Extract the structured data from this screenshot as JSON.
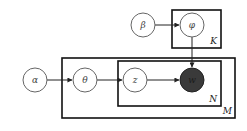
{
  "diagram": {
    "type": "plate-notation",
    "nodes": [
      {
        "id": "alpha",
        "label": "α",
        "observed": false
      },
      {
        "id": "theta",
        "label": "θ",
        "observed": false
      },
      {
        "id": "z",
        "label": "z",
        "observed": false
      },
      {
        "id": "w",
        "label": "w",
        "observed": true
      },
      {
        "id": "beta",
        "label": "β",
        "observed": false
      },
      {
        "id": "phi",
        "label": "φ",
        "observed": false
      }
    ],
    "edges": [
      {
        "from": "alpha",
        "to": "theta"
      },
      {
        "from": "theta",
        "to": "z"
      },
      {
        "from": "z",
        "to": "w"
      },
      {
        "from": "beta",
        "to": "phi"
      },
      {
        "from": "phi",
        "to": "w"
      }
    ],
    "plates": [
      {
        "id": "K",
        "label": "K",
        "contains": [
          "phi"
        ]
      },
      {
        "id": "M",
        "label": "M",
        "contains": [
          "theta",
          "z",
          "w"
        ]
      },
      {
        "id": "N",
        "label": "N",
        "contains": [
          "z",
          "w"
        ]
      }
    ]
  }
}
